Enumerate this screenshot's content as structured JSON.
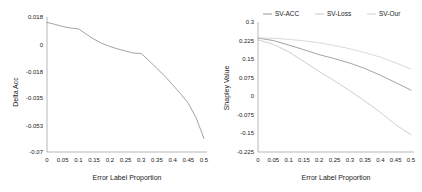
{
  "figure": {
    "panel_count": 2
  },
  "chart_data": [
    {
      "type": "line",
      "title": "",
      "xlabel": "Error Label Proportion",
      "ylabel": "Delta Acc",
      "xlim": [
        0,
        0.5
      ],
      "ylim": [
        -0.07,
        0.018
      ],
      "grid": false,
      "legend": null,
      "xticks": [
        "0",
        "0.05",
        "0.1",
        "0.15",
        "0.2",
        "0.25",
        "0.3",
        "0.35",
        "0.4",
        "0.45",
        "0.5"
      ],
      "yticks": [
        "0.018",
        "0",
        "-0.018",
        "-0.035",
        "-0.053",
        "-0.07"
      ],
      "x": [
        0,
        0.025,
        0.05,
        0.075,
        0.1,
        0.125,
        0.15,
        0.175,
        0.2,
        0.225,
        0.25,
        0.275,
        0.3,
        0.325,
        0.35,
        0.375,
        0.4,
        0.425,
        0.45,
        0.475,
        0.5
      ],
      "series": [
        {
          "name": "Delta Acc",
          "color": "#8c8c8c",
          "values": [
            0.0145,
            0.0132,
            0.0118,
            0.0108,
            0.0103,
            0.0068,
            0.0035,
            0.0008,
            -0.0012,
            -0.0028,
            -0.0042,
            -0.0055,
            -0.0058,
            -0.0105,
            -0.0155,
            -0.0205,
            -0.0262,
            -0.032,
            -0.0382,
            -0.0478,
            -0.0612
          ]
        }
      ]
    },
    {
      "type": "line",
      "title": "",
      "xlabel": "Error Label Proportion",
      "ylabel": "Shapley Value",
      "xlim": [
        0,
        0.5
      ],
      "ylim": [
        -0.225,
        0.3
      ],
      "grid": false,
      "legend_position": "top",
      "xticks": [
        "0",
        "0.05",
        "0.1",
        "0.15",
        "0.2",
        "0.25",
        "0.3",
        "0.35",
        "0.4",
        "0.45",
        "0.5"
      ],
      "yticks": [
        "0.3",
        "0.225",
        "0.15",
        "0.075",
        "0",
        "-0.075",
        "-0.15",
        "-0.225"
      ],
      "x": [
        0,
        0.05,
        0.1,
        0.15,
        0.2,
        0.25,
        0.3,
        0.35,
        0.4,
        0.45,
        0.5
      ],
      "series": [
        {
          "name": "SV-ACC",
          "color": "#8c8c8c",
          "values": [
            0.235,
            0.225,
            0.207,
            0.188,
            0.168,
            0.152,
            0.134,
            0.112,
            0.085,
            0.055,
            0.025
          ]
        },
        {
          "name": "SV-Loss",
          "color": "#c2c2c2",
          "values": [
            0.228,
            0.21,
            0.18,
            0.14,
            0.1,
            0.062,
            0.022,
            -0.02,
            -0.065,
            -0.115,
            -0.155
          ]
        },
        {
          "name": "SV-Our",
          "color": "#cfcfcf",
          "values": [
            0.236,
            0.234,
            0.23,
            0.224,
            0.216,
            0.205,
            0.192,
            0.176,
            0.158,
            0.135,
            0.11
          ]
        }
      ]
    }
  ]
}
